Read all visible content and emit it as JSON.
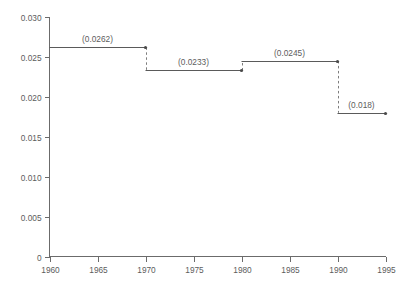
{
  "chart_data": {
    "type": "line",
    "subtype": "step",
    "title": "",
    "xlabel": "",
    "ylabel": "",
    "xlim": [
      1960,
      1995
    ],
    "ylim": [
      0,
      0.03
    ],
    "grid": false,
    "legend": null,
    "xticks": [
      "1960",
      "1965",
      "1970",
      "1975",
      "1980",
      "1985",
      "1990",
      "1995"
    ],
    "xtick_values": [
      1960,
      1965,
      1970,
      1975,
      1980,
      1985,
      1990,
      1995
    ],
    "yticks": [
      "0",
      "0.005",
      "0.010",
      "0.015",
      "0.020",
      "0.025",
      "0.030"
    ],
    "ytick_values": [
      0,
      0.005,
      0.01,
      0.015,
      0.02,
      0.025,
      0.03
    ],
    "steps": [
      {
        "x_start": 1960,
        "x_end": 1970,
        "value": 0.0262,
        "label": "(0.0262)"
      },
      {
        "x_start": 1970,
        "x_end": 1980,
        "value": 0.0233,
        "label": "(0.0233)"
      },
      {
        "x_start": 1980,
        "x_end": 1990,
        "value": 0.0245,
        "label": "(0.0245)"
      },
      {
        "x_start": 1990,
        "x_end": 1995,
        "value": 0.018,
        "label": "(0.018)"
      }
    ],
    "connectors": [
      {
        "x": 1970,
        "from": 0.0262,
        "to": 0.0233,
        "style": "dashed"
      },
      {
        "x": 1980,
        "from": 0.0233,
        "to": 0.0245,
        "style": "dashed"
      },
      {
        "x": 1990,
        "from": 0.0245,
        "to": 0.018,
        "style": "dashed"
      }
    ],
    "colors": {
      "background": "#ffffff",
      "axis": "#6b6b6b",
      "line": "#5a5a5a",
      "connector": "#7d7d7d",
      "text": "#5c5c5c"
    }
  }
}
